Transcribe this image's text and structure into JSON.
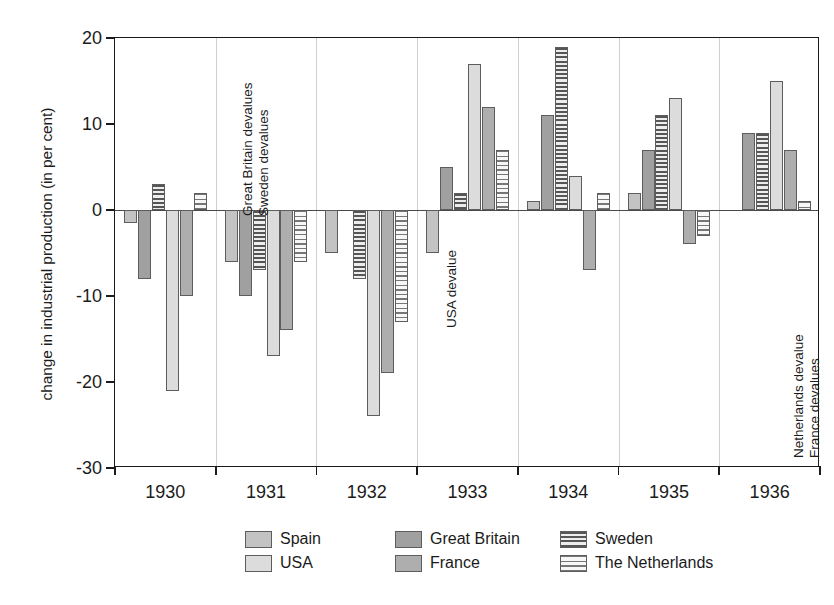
{
  "chart_data": {
    "type": "bar",
    "title": "",
    "subtitle": "",
    "xlabel": "",
    "ylabel": "change in industrial production (in per cent)",
    "categories": [
      "1930",
      "1931",
      "1932",
      "1933",
      "1934",
      "1935",
      "1936"
    ],
    "ylim": [
      -30,
      20
    ],
    "yticks": [
      20,
      10,
      0,
      -10,
      -20,
      -30
    ],
    "ytick_labels": [
      "20",
      "10",
      "0",
      "-10",
      "-20",
      "-30"
    ],
    "grid": "vertical-category-separators",
    "legend_position": "bottom",
    "series": [
      {
        "name": "Spain",
        "color": "#c3c3c3",
        "pattern": "solid",
        "values": [
          -1.5,
          -6,
          -5,
          -5,
          1,
          2,
          null
        ]
      },
      {
        "name": "Great Britain",
        "color": "#a0a0a0",
        "pattern": "solid",
        "values": [
          -8,
          -10,
          null,
          5,
          11,
          7,
          9
        ]
      },
      {
        "name": "Sweden",
        "color": "#565656",
        "pattern": "dense-horizontal-stripes",
        "values": [
          3,
          -7,
          -8,
          2,
          19,
          11,
          9
        ]
      },
      {
        "name": "USA",
        "color": "#dcdcdc",
        "pattern": "solid",
        "values": [
          -21,
          -17,
          -24,
          17,
          4,
          13,
          15
        ]
      },
      {
        "name": "France",
        "color": "#aeaeae",
        "pattern": "solid",
        "values": [
          -10,
          -14,
          -19,
          12,
          -7,
          -4,
          7
        ]
      },
      {
        "name": "The Netherlands",
        "color": "#767676",
        "pattern": "light-horizontal-stripes",
        "values": [
          2,
          -6,
          -13,
          7,
          2,
          -3,
          1
        ]
      }
    ],
    "annotations": [
      {
        "text": "Great Britain devalues",
        "category": "1931",
        "orientation": "vertical"
      },
      {
        "text": "Sweden devalues",
        "category": "1931",
        "orientation": "vertical"
      },
      {
        "text": "USA devalue",
        "category": "1933",
        "orientation": "vertical"
      },
      {
        "text": "Netherlands devalue",
        "category": "1936",
        "orientation": "vertical"
      },
      {
        "text": "France devalues",
        "category": "1936",
        "orientation": "vertical"
      }
    ]
  },
  "legend": {
    "entries": [
      {
        "label": "Spain"
      },
      {
        "label": "Great Britain"
      },
      {
        "label": "Sweden"
      },
      {
        "label": "USA"
      },
      {
        "label": "France"
      },
      {
        "label": "The Netherlands"
      }
    ]
  }
}
